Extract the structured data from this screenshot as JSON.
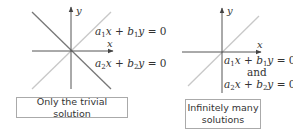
{
  "panels": [
    {
      "id": "left",
      "axis_labels": {
        "x": "x",
        "y": "y"
      },
      "equations": [
        {
          "coef_a": "a",
          "sub_a": "1",
          "var_x": "x",
          "plus": "+",
          "coef_b": "b",
          "sub_b": "1",
          "var_y": "y",
          "rhs": "= 0"
        },
        {
          "coef_a": "a",
          "sub_a": "2",
          "var_x": "x",
          "plus": "+",
          "coef_b": "b",
          "sub_b": "2",
          "var_y": "y",
          "rhs": "= 0"
        }
      ],
      "caption": "Only the trivial solution",
      "lines": [
        {
          "name": "line-1",
          "color": "#c8c8c8",
          "desc": "a1x + b1y = 0 (positive slope)"
        },
        {
          "name": "line-2",
          "color": "#777777",
          "desc": "a2x + b2y = 0 (negative slope)"
        }
      ]
    },
    {
      "id": "right",
      "axis_labels": {
        "x": "x",
        "y": "y"
      },
      "equations": [
        {
          "coef_a": "a",
          "sub_a": "1",
          "var_x": "x",
          "plus": "+",
          "coef_b": "b",
          "sub_b": "1",
          "var_y": "y",
          "rhs": "= 0"
        },
        {
          "coef_a": "a",
          "sub_a": "2",
          "var_x": "x",
          "plus": "+",
          "coef_b": "b",
          "sub_b": "2",
          "var_y": "y",
          "rhs": "= 0"
        }
      ],
      "connector": "and",
      "caption_lines": [
        "Infinitely many",
        "solutions"
      ],
      "lines": [
        {
          "name": "coincident-line",
          "color": "#c8c8c8",
          "desc": "both equations same line"
        }
      ]
    }
  ],
  "colors": {
    "axis": "#555555",
    "light_line": "#c8c8c8",
    "dark_line": "#777777",
    "box_border": "#aaaaaa",
    "text": "#333333"
  }
}
